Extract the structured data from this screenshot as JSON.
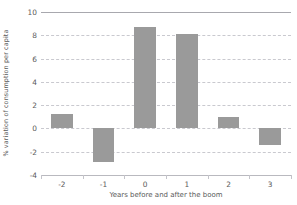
{
  "chart_data": {
    "type": "bar",
    "title": "",
    "xlabel": "Years before and after the boom",
    "ylabel": "% variation of consumption per capita",
    "categories": [
      "-2",
      "-1",
      "0",
      "1",
      "2",
      "3"
    ],
    "values": [
      1.2,
      -2.9,
      8.7,
      8.1,
      1.0,
      -1.4
    ],
    "series": [
      {
        "name": "% variation of consumption per capita",
        "values": [
          1.2,
          -2.9,
          8.7,
          8.1,
          1.0,
          -1.4
        ]
      }
    ],
    "ylim": [
      -4,
      10
    ],
    "ytick_labels": [
      "10",
      "8",
      "6",
      "4",
      "2",
      "0",
      "-2",
      "-4"
    ],
    "ytick_values": [
      10,
      8,
      6,
      4,
      2,
      0,
      -2,
      -4
    ],
    "ystep": 2,
    "grid": true,
    "grid_style": "dashed-horizontal",
    "legend": "none",
    "bar_color": "#9a9a9a",
    "grid_color": "#c9c9cf",
    "axis_color": "#b9b9bf",
    "text_color": "#5a5a5a",
    "background": "#ffffff"
  }
}
